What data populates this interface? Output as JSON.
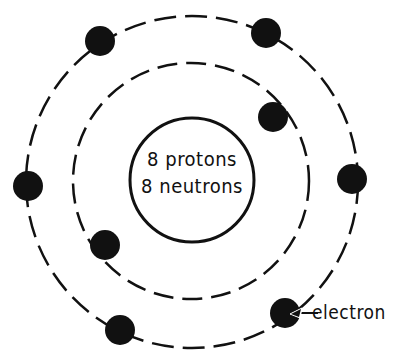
{
  "nucleus": {
    "line1": "8 protons",
    "line2": "8 neutrons"
  },
  "labels": {
    "electron": "electron"
  },
  "colors": {
    "ink": "#111111",
    "background": "#ffffff"
  },
  "orbits": [
    {
      "name": "inner-shell",
      "electrons": 2
    },
    {
      "name": "outer-shell",
      "electrons": 6
    }
  ]
}
